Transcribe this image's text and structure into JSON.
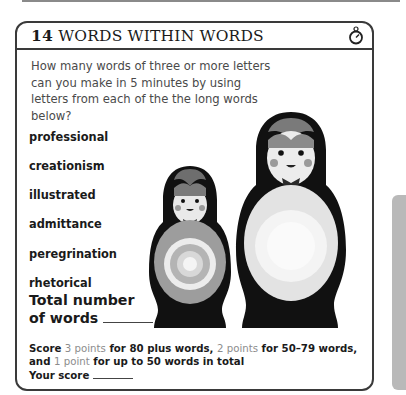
{
  "page": {
    "decor": {
      "top_rule_color": "#8a8a8a",
      "side_tab_color": "#b9b9b9"
    }
  },
  "header": {
    "number": "14",
    "title": "WORDS WITHIN WORDS",
    "icon": "stopwatch-icon"
  },
  "intro": "How many words of three or more letters can you make in 5 minutes by using letters from each of the the long words below?",
  "words": [
    {
      "label": "professional"
    },
    {
      "label": "creationism"
    },
    {
      "label": "illustrated"
    },
    {
      "label": "admittance"
    },
    {
      "label": "peregrination"
    },
    {
      "label": "rhetorical"
    }
  ],
  "total": {
    "line1": "Total number",
    "line2": "of words",
    "value": ""
  },
  "scoring": {
    "score_word": "Score",
    "tier1_points": "3 points",
    "tier1_text": "for 80 plus words,",
    "tier2_points": "2 points",
    "tier2_text": "for 50–79 words,",
    "and_word": "and",
    "tier3_points": "1 point",
    "tier3_text": "for up to 50 words in total",
    "your_score_label": "Your score",
    "your_score_value": "",
    "accent_color": "#8c8c8c"
  },
  "illustration": {
    "name": "matryoshka-dolls",
    "count": 2
  }
}
